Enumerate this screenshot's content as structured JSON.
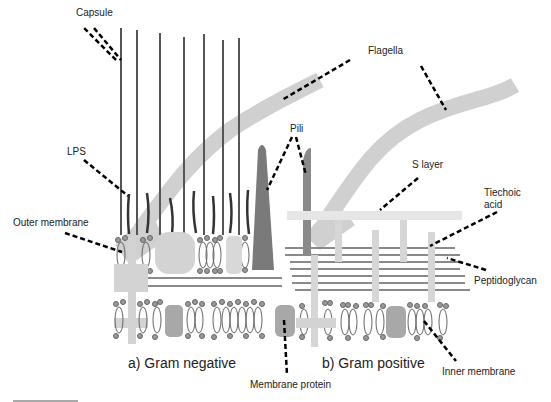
{
  "diagram": {
    "colors": {
      "capsule_line": "#555555",
      "lps_line": "#444444",
      "flagella": "#d0d0d0",
      "pili": "#7a7a7a",
      "protein_light": "#d3d3d3",
      "protein_mid": "#a8a8a8",
      "peptidoglycan": "#8a8a8a",
      "lipid_head": "#999999",
      "s_layer": "#e6e6e6",
      "leader": "#000000"
    },
    "labels": {
      "capsule": "Capsule",
      "flagella": "Flagella",
      "pili": "Pili",
      "lps": "LPS",
      "s_layer": "S layer",
      "teichoic_line1": "Tiechoic",
      "teichoic_line2": "acid",
      "outer_membrane": "Outer membrane",
      "peptidoglycan": "Peptidoglycan",
      "inner_membrane": "Inner membrane",
      "membrane_protein": "Membrane protein"
    },
    "panels": [
      {
        "id": "a",
        "caption": "a) Gram negative"
      },
      {
        "id": "b",
        "caption": "b) Gram positive"
      }
    ]
  }
}
